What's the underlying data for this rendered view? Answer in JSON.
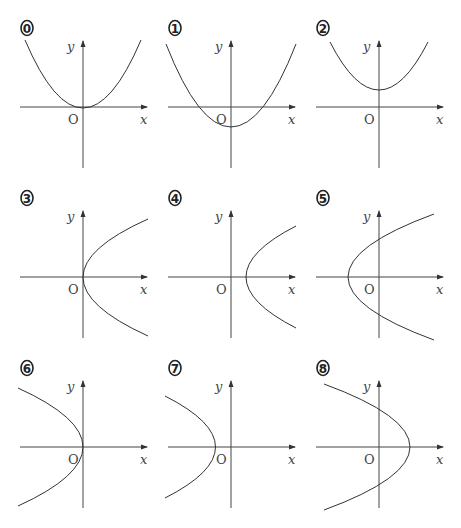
{
  "panels": [
    {
      "id": "0",
      "label": "⓪",
      "curve": "parabola-up",
      "description": "y = x^2, vertex at origin",
      "ox": 83,
      "oy": 107,
      "curve_path": "M25,40 Q83,176 141,40"
    },
    {
      "id": "1",
      "label": "①",
      "curve": "parabola-up",
      "description": "y = x^2 - c, vertex below origin",
      "ox": 231,
      "oy": 107,
      "curve_path": "M166,44 Q231,210 296,44"
    },
    {
      "id": "2",
      "label": "②",
      "curve": "parabola-up",
      "description": "y = x^2 + c, vertex above origin",
      "ox": 379,
      "oy": 107,
      "curve_path": "M330,42 Q379,138 428,42"
    },
    {
      "id": "3",
      "label": "③",
      "curve": "parabola-right",
      "description": "x = y^2, vertex at origin",
      "ox": 83,
      "oy": 277,
      "curve_path": "M148,219 Q18,277 148,336"
    },
    {
      "id": "4",
      "label": "④",
      "curve": "parabola-right",
      "description": "x = y^2 + c, vertex right of origin",
      "ox": 231,
      "oy": 277,
      "curve_path": "M296,226 Q196,277 296,328"
    },
    {
      "id": "5",
      "label": "⑤",
      "curve": "parabola-right",
      "description": "x = y^2 - c, vertex left of origin",
      "ox": 379,
      "oy": 277,
      "curve_path": "M434,214 Q262,277 434,340"
    },
    {
      "id": "6",
      "label": "⑥",
      "curve": "parabola-left",
      "description": "x = -y^2, vertex at origin",
      "ox": 83,
      "oy": 447,
      "curve_path": "M18,388 Q148,447 18,506"
    },
    {
      "id": "7",
      "label": "⑦",
      "curve": "parabola-left",
      "description": "x = -y^2 - c, vertex left of origin",
      "ox": 231,
      "oy": 447,
      "curve_path": "M165,396 Q266,447 165,498"
    },
    {
      "id": "8",
      "label": "⑧",
      "curve": "parabola-left",
      "description": "x = -y^2 + c, vertex right of origin",
      "ox": 379,
      "oy": 447,
      "curve_path": "M324,384 Q496,447 324,510"
    }
  ],
  "axis_labels": {
    "x": "x",
    "y": "y",
    "origin": "O"
  }
}
